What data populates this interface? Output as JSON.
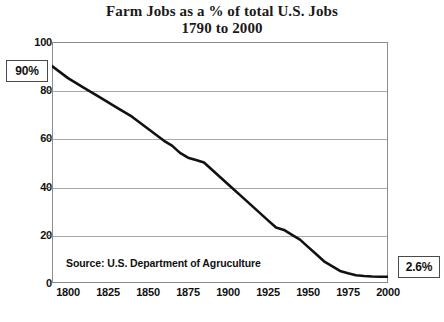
{
  "chart_data": {
    "type": "line",
    "title": "Farm Jobs as a % of total U.S. Jobs",
    "subtitle": "1790 to 2000",
    "xlabel": "",
    "ylabel": "",
    "xlim": [
      1790,
      2000
    ],
    "ylim": [
      0,
      100
    ],
    "grid": true,
    "legend": "none",
    "source_note": "Source: U.S. Department of Agruculture",
    "yticks": [
      "0",
      "20",
      "40",
      "60",
      "80",
      "100"
    ],
    "ytick_values": [
      0,
      20,
      40,
      60,
      80,
      100
    ],
    "xticks": [
      "1800",
      "1825",
      "1850",
      "1875",
      "1900",
      "1925",
      "1950",
      "1975",
      "2000"
    ],
    "xtick_values": [
      1800,
      1825,
      1850,
      1875,
      1900,
      1925,
      1950,
      1975,
      2000
    ],
    "series": [
      {
        "name": "Farm Jobs as % of total U.S. Jobs",
        "color": "#111111",
        "x": [
          1790,
          1800,
          1810,
          1820,
          1830,
          1840,
          1850,
          1860,
          1865,
          1870,
          1875,
          1880,
          1885,
          1890,
          1895,
          1900,
          1910,
          1920,
          1925,
          1930,
          1935,
          1940,
          1945,
          1950,
          1955,
          1960,
          1965,
          1970,
          1975,
          1980,
          1985,
          1990,
          1995,
          2000
        ],
        "y": [
          90,
          85,
          81,
          77,
          73,
          69,
          64,
          59,
          57,
          54,
          52,
          51,
          50,
          47,
          44,
          41,
          35,
          29,
          26,
          23,
          22,
          20,
          18,
          15,
          12,
          9,
          7,
          5,
          4,
          3.2,
          2.9,
          2.7,
          2.6,
          2.6
        ]
      }
    ],
    "annotations": [
      {
        "id": "start-callout",
        "text": "90%",
        "x": 1790,
        "y": 90
      },
      {
        "id": "end-callout",
        "text": "2.6%",
        "x": 2000,
        "y": 2.6
      }
    ]
  },
  "chart": {
    "title_line1": "Farm Jobs as a % of total U.S. Jobs",
    "title_line2": "1790 to 2000",
    "source_note": "Source: U.S. Department of Agruculture",
    "callout_start": "90%",
    "callout_end": "2.6%",
    "y_labels": [
      "100",
      "80",
      "60",
      "40",
      "20",
      "0"
    ],
    "x_labels": [
      "1800",
      "1825",
      "1850",
      "1875",
      "1900",
      "1925",
      "1950",
      "1975",
      "2000"
    ]
  }
}
